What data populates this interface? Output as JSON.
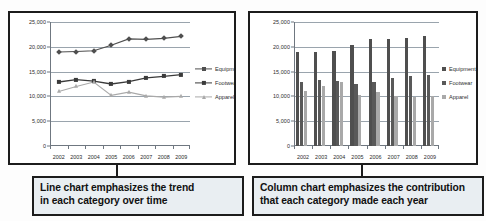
{
  "page": {
    "background_color": "#fdfdfd",
    "frame_color": "#1c1c1c",
    "caption_background": "#e9eef2"
  },
  "colors": {
    "equipment": "#4f4f4f",
    "footwear": "#3a3a3a",
    "apparel": "#a9a9a9",
    "gridline": "#9aa4ad",
    "axis": "#6f7780",
    "text": "#2b2b2b"
  },
  "panels": [
    {
      "id": "line-chart-panel",
      "caption": {
        "line1": "Line chart emphasizes the trend",
        "line2": "in each category over time"
      }
    },
    {
      "id": "column-chart-panel",
      "caption": {
        "line1": "Column chart emphasizes the contribution",
        "line2": "that each category made each year"
      }
    }
  ],
  "chart_data": [
    {
      "id": "line-chart",
      "type": "line",
      "title": "",
      "xlabel": "",
      "ylabel": "",
      "categories": [
        "2002",
        "2003",
        "2004",
        "2005",
        "2006",
        "2007",
        "2008",
        "2009"
      ],
      "ylim": [
        0,
        25000
      ],
      "yticks": [
        0,
        5000,
        10000,
        15000,
        20000,
        25000
      ],
      "ytick_labels": [
        "0",
        "5,000",
        "10,000",
        "15,000",
        "20,000",
        "25,000"
      ],
      "grid": true,
      "legend_position": "right",
      "series": [
        {
          "name": "Equipment",
          "marker": "diamond",
          "color": "#4f4f4f",
          "values": [
            18950,
            19050,
            19200,
            20300,
            21600,
            21500,
            21700,
            22100
          ]
        },
        {
          "name": "Footwear",
          "marker": "square",
          "color": "#3a3a3a",
          "values": [
            12900,
            13400,
            13100,
            12500,
            13000,
            13750,
            14050,
            14400
          ]
        },
        {
          "name": "Apparel",
          "marker": "triangle",
          "color": "#a9a9a9",
          "values": [
            11000,
            12000,
            12900,
            10200,
            10850,
            10100,
            9850,
            10000
          ]
        }
      ]
    },
    {
      "id": "column-chart",
      "type": "bar",
      "title": "",
      "xlabel": "",
      "ylabel": "",
      "categories": [
        "2002",
        "2003",
        "2004",
        "2005",
        "2006",
        "2007",
        "2008",
        "2009"
      ],
      "ylim": [
        0,
        25000
      ],
      "yticks": [
        0,
        5000,
        10000,
        15000,
        20000,
        25000
      ],
      "ytick_labels": [
        "0",
        "5,000",
        "10,000",
        "15,000",
        "20,000",
        "25,000"
      ],
      "grid": true,
      "legend_position": "right",
      "series": [
        {
          "name": "Equipment",
          "color": "#4f4f4f",
          "values": [
            18950,
            19050,
            19200,
            20300,
            21600,
            21500,
            21700,
            22100
          ]
        },
        {
          "name": "Footwear",
          "color": "#595959",
          "values": [
            12900,
            13400,
            13100,
            12500,
            13000,
            13750,
            14050,
            14400
          ]
        },
        {
          "name": "Apparel",
          "color": "#a9a9a9",
          "values": [
            11000,
            12000,
            12900,
            10200,
            10850,
            10100,
            9850,
            10000
          ]
        }
      ]
    }
  ]
}
